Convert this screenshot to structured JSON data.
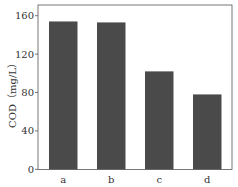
{
  "chart_data": {
    "type": "bar",
    "title": "",
    "xlabel": "",
    "ylabel": "COD（mg/L）",
    "categories": [
      "a",
      "b",
      "c",
      "d"
    ],
    "values": [
      154,
      153,
      102,
      78
    ],
    "ylim": [
      0,
      160
    ],
    "yticks": [
      0,
      40,
      80,
      120,
      160
    ],
    "ytick_labels": [
      "0",
      "40",
      "80",
      "120",
      "160"
    ],
    "grid": false,
    "legend": null,
    "bar_color": "#4a4a4a",
    "axis_color": "#555555"
  }
}
